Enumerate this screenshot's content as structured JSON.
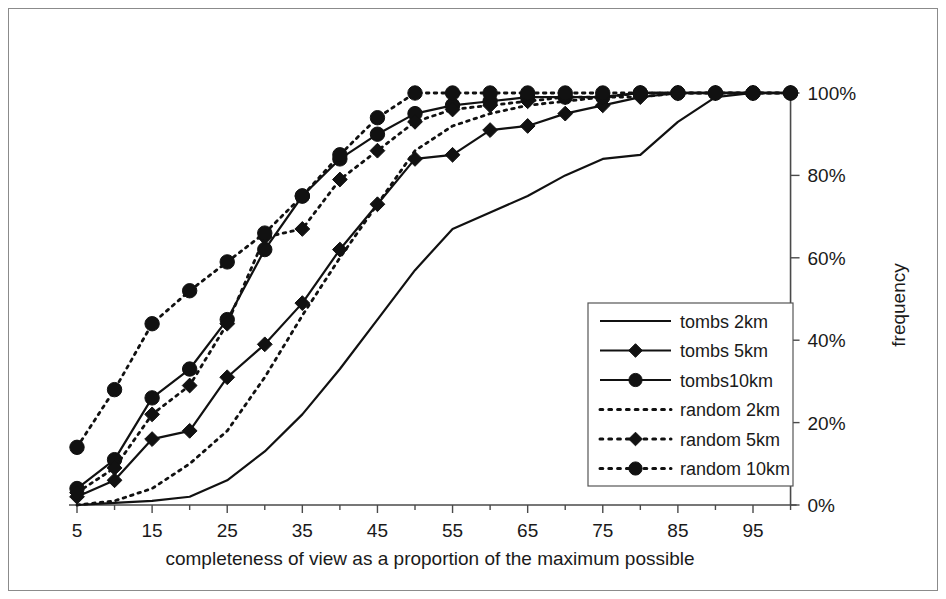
{
  "chart_data": {
    "type": "line",
    "title": "",
    "subtitle": "",
    "xlabel": "completeness of view as a proportion of the maximum possible",
    "ylabel": "frequency",
    "x": [
      5,
      10,
      15,
      20,
      25,
      30,
      35,
      40,
      45,
      50,
      55,
      60,
      65,
      70,
      75,
      80,
      85,
      90,
      95,
      100
    ],
    "xlim": [
      5,
      100
    ],
    "ylim": [
      0,
      100
    ],
    "xticks": [
      5,
      15,
      25,
      35,
      45,
      55,
      65,
      75,
      85,
      95
    ],
    "xtick_labels": [
      "5",
      "15",
      "25",
      "35",
      "45",
      "55",
      "65",
      "75",
      "85",
      "95"
    ],
    "xminor_ticks": [
      10,
      20,
      30,
      40,
      50,
      60,
      70,
      80,
      90,
      100
    ],
    "yticks": [
      0,
      20,
      40,
      60,
      80,
      100
    ],
    "ytick_labels": [
      "0%",
      "20%",
      "40%",
      "60%",
      "80%",
      "100%"
    ],
    "y_axis_position": "right",
    "grid": false,
    "legend_position": "middle-right-inside",
    "series": [
      {
        "name": "tombs 2km",
        "style": "solid",
        "marker": "none",
        "values": [
          0,
          0.5,
          1,
          2,
          6,
          13,
          22,
          33,
          45,
          57,
          67,
          71,
          75,
          80,
          84,
          85,
          93,
          99,
          100,
          100
        ]
      },
      {
        "name": "tombs 5km",
        "style": "solid",
        "marker": "diamond",
        "values": [
          2,
          6,
          16,
          18,
          31,
          39,
          49,
          62,
          73,
          84,
          85,
          91,
          92,
          95,
          97,
          99,
          100,
          100,
          100,
          100
        ]
      },
      {
        "name": "tombs 10km",
        "style": "solid",
        "marker": "circle",
        "values": [
          4,
          11,
          26,
          33,
          45,
          62,
          75,
          84,
          90,
          95,
          97,
          98,
          99,
          99,
          99,
          100,
          100,
          100,
          100,
          100
        ]
      },
      {
        "name": "random 2km",
        "style": "dotted",
        "marker": "none",
        "values": [
          0,
          1,
          4,
          10,
          18,
          31,
          46,
          60,
          73,
          86,
          92,
          95,
          97,
          98,
          99,
          99,
          100,
          100,
          100,
          100
        ]
      },
      {
        "name": "random 5km",
        "style": "dotted",
        "marker": "diamond",
        "values": [
          3,
          9,
          22,
          29,
          44,
          65,
          67,
          79,
          86,
          93,
          96,
          97,
          98,
          99,
          99,
          100,
          100,
          100,
          100,
          100
        ]
      },
      {
        "name": "random 10km",
        "style": "dotted",
        "marker": "circle",
        "values": [
          14,
          28,
          44,
          52,
          59,
          66,
          75,
          85,
          94,
          100,
          100,
          100,
          100,
          100,
          100,
          100,
          100,
          100,
          100,
          100
        ]
      }
    ],
    "legend_entries": [
      {
        "label": "tombs 2km",
        "style": "solid",
        "marker": "none"
      },
      {
        "label": "tombs 5km",
        "style": "solid",
        "marker": "diamond"
      },
      {
        "label": "tombs10km",
        "style": "solid",
        "marker": "circle"
      },
      {
        "label": "random 2km",
        "style": "dotted",
        "marker": "none"
      },
      {
        "label": "random 5km",
        "style": "dotted",
        "marker": "diamond"
      },
      {
        "label": "random 10km",
        "style": "dotted",
        "marker": "circle"
      }
    ],
    "colors": {
      "series": "#111111",
      "axis": "#4a4a4a",
      "text": "#1a1a1a",
      "background": "#ffffff",
      "frame": "#8b8b8b"
    }
  }
}
